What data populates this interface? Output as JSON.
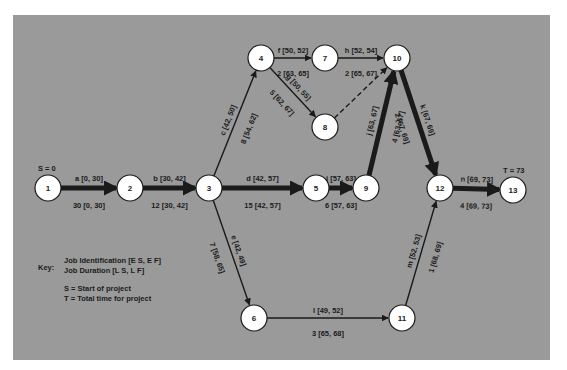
{
  "diagram": {
    "type": "PERT/CPM network",
    "start_label": "S = 0",
    "end_label": "T = 73",
    "nodes": [
      {
        "id": "1",
        "x": 48,
        "y": 188
      },
      {
        "id": "2",
        "x": 130,
        "y": 188
      },
      {
        "id": "3",
        "x": 209,
        "y": 188
      },
      {
        "id": "4",
        "x": 261,
        "y": 58
      },
      {
        "id": "5",
        "x": 316,
        "y": 188
      },
      {
        "id": "6",
        "x": 254,
        "y": 318
      },
      {
        "id": "7",
        "x": 325,
        "y": 58
      },
      {
        "id": "8",
        "x": 325,
        "y": 127
      },
      {
        "id": "9",
        "x": 366,
        "y": 188
      },
      {
        "id": "10",
        "x": 397,
        "y": 58
      },
      {
        "id": "11",
        "x": 402,
        "y": 318
      },
      {
        "id": "12",
        "x": 440,
        "y": 188
      },
      {
        "id": "13",
        "x": 513,
        "y": 190
      }
    ],
    "edges": [
      {
        "from": "1",
        "to": "2",
        "job": "a [0, 30]",
        "duration": "30 [0, 30]",
        "critical": true
      },
      {
        "from": "2",
        "to": "3",
        "job": "b [30, 42]",
        "duration": "12 [30, 42]",
        "critical": true
      },
      {
        "from": "3",
        "to": "4",
        "job": "c [42, 50]",
        "duration": "8 [54, 62]",
        "critical": false
      },
      {
        "from": "3",
        "to": "5",
        "job": "d [42, 57]",
        "duration": "15 [42, 57]",
        "critical": true
      },
      {
        "from": "3",
        "to": "6",
        "job": "e [42, 49]",
        "duration": "7 [58, 65]",
        "critical": false
      },
      {
        "from": "4",
        "to": "7",
        "job": "f [50, 52]",
        "duration": "2 [63, 65]",
        "critical": false
      },
      {
        "from": "4",
        "to": "8",
        "job": "g [50, 55]",
        "duration": "5 [62, 67]",
        "critical": false
      },
      {
        "from": "7",
        "to": "10",
        "job": "h [52, 54]",
        "duration": "2 [65, 67]",
        "critical": false
      },
      {
        "from": "8",
        "to": "10",
        "job": "",
        "duration": "",
        "critical": false,
        "dummy": true
      },
      {
        "from": "5",
        "to": "9",
        "job": "i [57, 63]",
        "duration": "6 [57, 63]",
        "critical": true
      },
      {
        "from": "9",
        "to": "10",
        "job": "j [63, 67]",
        "duration": "4 [63, 67]",
        "critical": true
      },
      {
        "from": "10",
        "to": "12",
        "job": "k [67, 69]",
        "duration": "2 [67, 69]",
        "critical": true
      },
      {
        "from": "6",
        "to": "11",
        "job": "l [49, 52]",
        "duration": "3 [65, 68]",
        "critical": false
      },
      {
        "from": "11",
        "to": "12",
        "job": "m [52, 53]",
        "duration": "1 [68, 69]",
        "critical": false
      },
      {
        "from": "12",
        "to": "13",
        "job": "n [69, 73]",
        "duration": "4 [69, 73]",
        "critical": true
      }
    ]
  },
  "key": {
    "title": "Key:",
    "line1": "Job Identification [E S, E F]",
    "line2": "Job Duration [L S, L F]",
    "s_def": "S = Start of project",
    "t_def": "T = Total time for project"
  },
  "colors": {
    "panel": "#9a9a9a",
    "node_fill": "#ffffff",
    "stroke": "#1a1a1a"
  }
}
